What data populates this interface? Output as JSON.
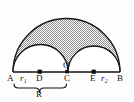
{
  "figure": {
    "labels": {
      "point_a": "A",
      "point_b": "B",
      "point_c": "C",
      "point_d": "D",
      "point_e": "E",
      "point_o": "O",
      "radius_small_left": "r₁",
      "radius_small_right": "r₂",
      "radius_large": "R"
    },
    "colors": {
      "stroke": "#111111",
      "shading": "#9a9a9a",
      "background": "#ffffff"
    },
    "geometry": {
      "baseline_y": 72,
      "point_a_x": 13,
      "point_c_x": 68,
      "point_b_x": 120,
      "point_d_x": 40,
      "point_e_x": 94,
      "point_o_x": 67,
      "large_radius": 53.5,
      "small_left_radius": 27.5,
      "small_right_radius": 26,
      "shaded_region": "large semicircle minus two small semicircles"
    }
  }
}
